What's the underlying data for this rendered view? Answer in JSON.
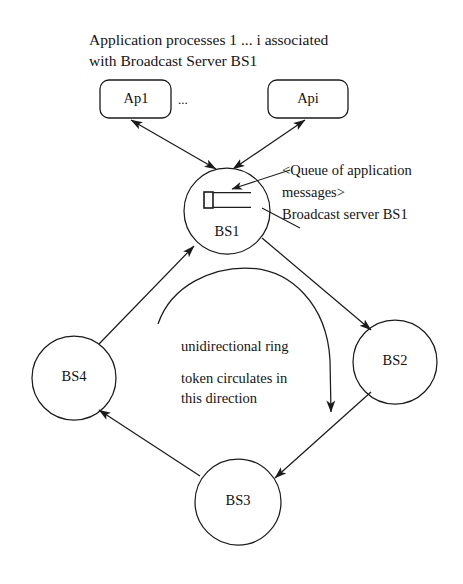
{
  "diagram": {
    "title_caption": {
      "line1": "Application processes 1 ... i associated",
      "line2": "with Broadcast Server BS1"
    },
    "app_processes": [
      {
        "id": "ap1",
        "label": "Ap1"
      },
      {
        "id": "api",
        "label": "Api"
      }
    ],
    "ellipsis": "...",
    "servers": [
      {
        "id": "bs1",
        "label": "BS1"
      },
      {
        "id": "bs2",
        "label": "BS2"
      },
      {
        "id": "bs3",
        "label": "BS3"
      },
      {
        "id": "bs4",
        "label": "BS4"
      }
    ],
    "queue_annotation": {
      "line1": "<Queue of application",
      "line2": "messages>",
      "line3": "Broadcast server BS1"
    },
    "ring_annotation": {
      "line1": "unidirectional ring",
      "line2": "token circulates in",
      "line3": "this direction"
    },
    "colors": {
      "background": "#ffffff",
      "stroke": "#1b1b1b",
      "text": "#141414"
    }
  }
}
